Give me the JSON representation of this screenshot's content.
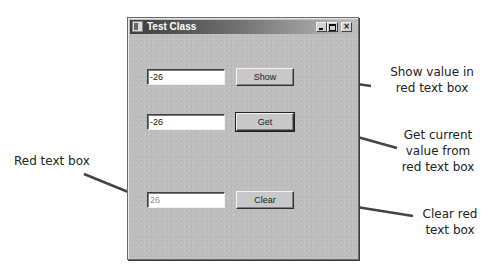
{
  "window": {
    "title": "Test Class",
    "controls": {
      "minimize": "_",
      "maximize": "□",
      "close": "×"
    }
  },
  "rows": [
    {
      "textbox_value": "-26",
      "button_label": "Show"
    },
    {
      "textbox_value": "-26",
      "button_label": "Get"
    },
    {
      "textbox_value": "26",
      "button_label": "Clear"
    }
  ],
  "annotations": {
    "show": [
      "Show value in",
      "red text box"
    ],
    "get": [
      "Get current",
      "value from",
      "red text box"
    ],
    "clear": [
      "Clear red",
      "text box"
    ],
    "red_text_box": "Red text box"
  },
  "colors": {
    "window_bg": "#bdbdbd",
    "title_dark": "#3c3c3c",
    "leader_line": "#444444"
  }
}
